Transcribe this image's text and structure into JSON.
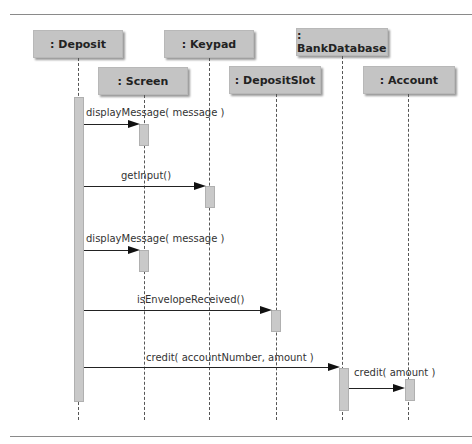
{
  "diagram": {
    "type": "UML sequence diagram",
    "objects": [
      {
        "id": "deposit",
        "label": ": Deposit"
      },
      {
        "id": "keypad",
        "label": ": Keypad"
      },
      {
        "id": "bankdatabase",
        "label": ": BankDatabase"
      },
      {
        "id": "screen",
        "label": ": Screen"
      },
      {
        "id": "depositslot",
        "label": ": DepositSlot"
      },
      {
        "id": "account",
        "label": ": Account"
      }
    ],
    "messages": [
      {
        "from": "deposit",
        "to": "screen",
        "label": "displayMessage( message )"
      },
      {
        "from": "deposit",
        "to": "keypad",
        "label": "getInput()"
      },
      {
        "from": "deposit",
        "to": "screen",
        "label": "displayMessage( message )"
      },
      {
        "from": "deposit",
        "to": "depositslot",
        "label": "isEnvelopeReceived()"
      },
      {
        "from": "deposit",
        "to": "bankdatabase",
        "label": "credit( accountNumber, amount )"
      },
      {
        "from": "bankdatabase",
        "to": "account",
        "label": "credit( amount )"
      }
    ]
  }
}
